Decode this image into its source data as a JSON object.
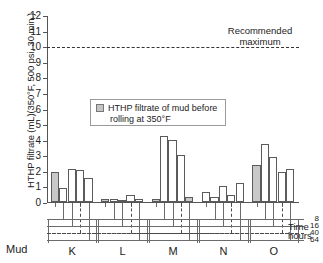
{
  "chart_data": {
    "type": "bar",
    "title": "",
    "ylabel": "HTHP filtrate  (mL)(350°F, 500 psi, 30 min.)",
    "xlabel": "Mud",
    "ylim": [
      0,
      12
    ],
    "yticks": [
      0,
      1,
      2,
      3,
      4,
      5,
      6,
      7,
      8,
      9,
      10,
      11,
      12
    ],
    "ytick_labels": [
      "0",
      "1",
      "2",
      "3",
      "4",
      "5",
      "6",
      "7",
      "8",
      "9",
      "10",
      "11",
      "12"
    ],
    "grid": false,
    "legend_position": "inside-upper-center",
    "legend": [
      {
        "label_line1": "HTHP filtrate of mud before",
        "label_line2": "rolling at 350°F",
        "swatch": "gray-filled"
      }
    ],
    "annotations": [
      {
        "name": "recommended-maximum",
        "text_line1": "Recommended",
        "text_line2": "maximum",
        "y_value": 10,
        "style": "dashed-horizontal-line"
      }
    ],
    "time_axis": {
      "label_line1": "Time",
      "label_line2": "hours",
      "tick_labels": [
        "8",
        "16",
        "40",
        "64"
      ],
      "tick_values": [
        8,
        16,
        40,
        64
      ]
    },
    "categories": [
      "K",
      "L",
      "M",
      "N",
      "O"
    ],
    "series_note": "Within each mud group the first (gray) bar is the before-rolling filtrate; the following open bars are after rolling for 8, 16, 40 and 64 hours.",
    "groups": [
      {
        "mud": "K",
        "bars": [
          {
            "label": "before",
            "value": 1.9,
            "fill": "gray"
          },
          {
            "label": "8",
            "value": 0.9,
            "fill": "white"
          },
          {
            "label": "16",
            "value": 2.1,
            "fill": "white"
          },
          {
            "label": "40",
            "value": 2.05,
            "fill": "white"
          },
          {
            "label": "64",
            "value": 1.55,
            "fill": "white"
          }
        ]
      },
      {
        "mud": "L",
        "bars": [
          {
            "label": "before",
            "value": 0.2,
            "fill": "gray"
          },
          {
            "label": "8",
            "value": 0.2,
            "fill": "white"
          },
          {
            "label": "16",
            "value": 0.15,
            "fill": "white"
          },
          {
            "label": "40",
            "value": 0.45,
            "fill": "white"
          },
          {
            "label": "64",
            "value": 0.2,
            "fill": "white"
          }
        ]
      },
      {
        "mud": "M",
        "bars": [
          {
            "label": "before",
            "value": 0.2,
            "fill": "gray"
          },
          {
            "label": "8",
            "value": 4.25,
            "fill": "white"
          },
          {
            "label": "16",
            "value": 4.0,
            "fill": "white"
          },
          {
            "label": "40",
            "value": 3.0,
            "fill": "white"
          },
          {
            "label": "64",
            "value": 0.35,
            "fill": "gray"
          }
        ]
      },
      {
        "mud": "N",
        "bars": [
          {
            "label": "before",
            "value": 0.65,
            "fill": "white"
          },
          {
            "label": "8",
            "value": 0.3,
            "fill": "white"
          },
          {
            "label": "16",
            "value": 1.05,
            "fill": "white"
          },
          {
            "label": "40",
            "value": 0.45,
            "fill": "white"
          },
          {
            "label": "64",
            "value": 1.2,
            "fill": "white"
          }
        ]
      },
      {
        "mud": "O",
        "bars": [
          {
            "label": "before",
            "value": 2.4,
            "fill": "gray"
          },
          {
            "label": "8",
            "value": 3.7,
            "fill": "white"
          },
          {
            "label": "16",
            "value": 2.9,
            "fill": "white"
          },
          {
            "label": "40",
            "value": 1.9,
            "fill": "white"
          },
          {
            "label": "64",
            "value": 2.1,
            "fill": "white"
          }
        ]
      }
    ]
  },
  "axis": {
    "y_title": "HTHP filtrate  (mL)(350°F, 500 psi, 30 min.)",
    "mud_row_label": "Mud"
  },
  "colors": {
    "bar_fill_gray": "#c8c8c8",
    "bar_outline": "#5b5b5b",
    "axis": "#555555",
    "dashed": "#333333",
    "background": "#ffffff"
  }
}
